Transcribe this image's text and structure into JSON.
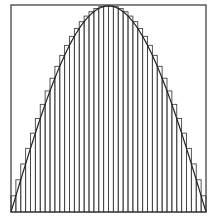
{
  "chart_data": {
    "type": "bar",
    "title": "",
    "xlabel": "",
    "ylabel": "",
    "function": "sin(pi*x)",
    "xlim": [
      0,
      1
    ],
    "ylim": [
      0,
      1
    ],
    "n_rectangles": 40,
    "sum_type": "upper",
    "grid": false,
    "legend": "none",
    "colors": {
      "stroke": "#333333",
      "background": "#ffffff"
    }
  }
}
